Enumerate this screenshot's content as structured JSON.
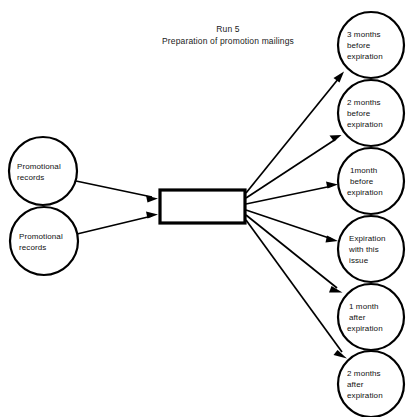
{
  "diagram": {
    "title_lines": [
      "Run 5",
      "Preparation of promotion mailings"
    ],
    "background_color": "#ffffff",
    "stroke_color": "#000000",
    "text_color": "#111111",
    "inputs": [
      {
        "id": "input-1",
        "lines": [
          "Promotional",
          "records"
        ],
        "cx": 43,
        "cy": 171,
        "r": 34
      },
      {
        "id": "input-2",
        "lines": [
          "Promotional",
          "records"
        ],
        "cx": 44,
        "cy": 241,
        "r": 34
      }
    ],
    "process": {
      "id": "process-box",
      "label": "",
      "x": 160,
      "y": 190,
      "width": 85,
      "height": 33
    },
    "outputs": [
      {
        "id": "output-1",
        "lines": [
          "3 months",
          "before",
          "expiration"
        ],
        "cx": 371,
        "cy": 45,
        "r": 33
      },
      {
        "id": "output-2",
        "lines": [
          "2 months",
          "before",
          "expiration"
        ],
        "cx": 371,
        "cy": 113,
        "r": 33
      },
      {
        "id": "output-3",
        "lines": [
          "1month",
          "before",
          "expiration"
        ],
        "cx": 371,
        "cy": 181,
        "r": 33
      },
      {
        "id": "output-4",
        "lines": [
          "Expiration",
          "with this",
          "issue"
        ],
        "cx": 371,
        "cy": 249,
        "r": 33
      },
      {
        "id": "output-5",
        "lines": [
          "1 month",
          "after",
          "expiration"
        ],
        "cx": 371,
        "cy": 317,
        "r": 33
      },
      {
        "id": "output-6",
        "lines": [
          "2 months",
          "after",
          "expiration"
        ],
        "cx": 371,
        "cy": 384,
        "r": 33
      }
    ],
    "connectors": [
      {
        "id": "conn-input-1",
        "from": "input-1",
        "to": "process-box",
        "x1": 76,
        "y1": 181,
        "x2": 157,
        "y2": 198
      },
      {
        "id": "conn-input-2",
        "from": "input-2",
        "to": "process-box",
        "x1": 77,
        "y1": 234,
        "x2": 157,
        "y2": 215
      },
      {
        "id": "conn-output-1",
        "from": "process-box",
        "to": "output-1",
        "x1": 246,
        "y1": 193,
        "x2": 344,
        "y2": 72
      },
      {
        "id": "conn-output-2",
        "from": "process-box",
        "to": "output-2",
        "x1": 246,
        "y1": 198,
        "x2": 341,
        "y2": 135
      },
      {
        "id": "conn-output-3",
        "from": "process-box",
        "to": "output-3",
        "x1": 246,
        "y1": 204,
        "x2": 337,
        "y2": 184
      },
      {
        "id": "conn-output-4",
        "from": "process-box",
        "to": "output-4",
        "x1": 246,
        "y1": 210,
        "x2": 337,
        "y2": 242
      },
      {
        "id": "conn-output-5",
        "from": "process-box",
        "to": "output-5",
        "x1": 246,
        "y1": 215,
        "x2": 342,
        "y2": 293
      },
      {
        "id": "conn-output-6",
        "from": "process-box",
        "to": "output-6",
        "x1": 246,
        "y1": 220,
        "x2": 347,
        "y2": 358
      }
    ]
  }
}
